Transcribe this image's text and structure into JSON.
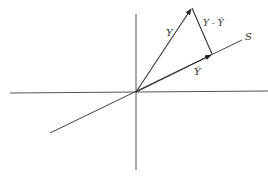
{
  "diagram": {
    "title": "",
    "type": "vector projection onto subspace",
    "labels": {
      "y_vector": "Y",
      "residual": "Y - Ŷ",
      "projection": "Ŷ",
      "subspace": "S"
    },
    "points": {
      "origin": [
        136,
        92
      ],
      "y_tip": [
        192,
        8
      ],
      "projection_tip": [
        212,
        54
      ]
    },
    "axes": {
      "horizontal": {
        "from": [
          10,
          93
        ],
        "to": [
          268,
          91
        ]
      },
      "vertical": {
        "from": [
          136,
          14
        ],
        "to": [
          136,
          170
        ]
      }
    },
    "subspace_line": {
      "from": [
        50,
        133
      ],
      "to": [
        242,
        40
      ]
    },
    "colors": {
      "stroke": "#444444",
      "background": "#ffffff"
    }
  }
}
